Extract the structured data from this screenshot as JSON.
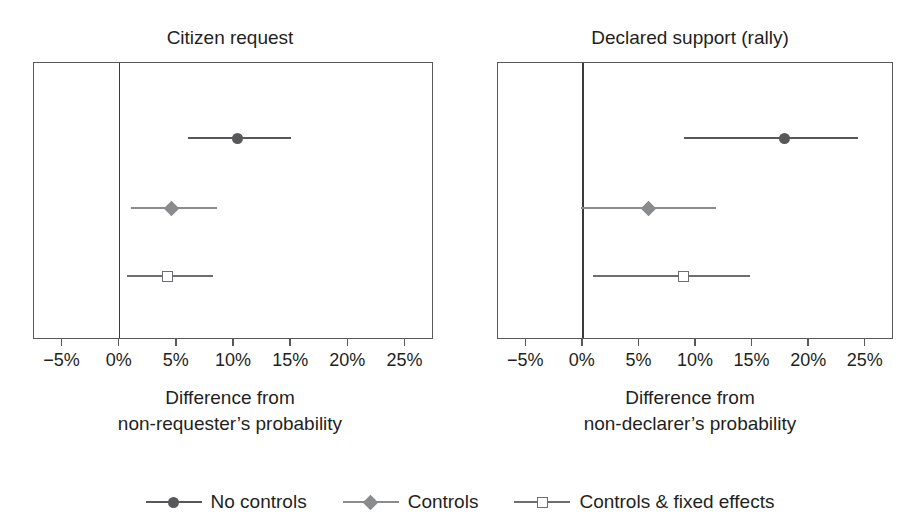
{
  "chart_data": {
    "type": "scatter",
    "subtype": "coefficient-plot-with-confidence-intervals",
    "title": "",
    "xlabel": "",
    "ylabel": "",
    "xlim": [
      -7.5,
      27.5
    ],
    "xticks": [
      -5,
      0,
      5,
      10,
      15,
      20,
      25
    ],
    "xtick_labels": [
      "−5%",
      "0%",
      "5%",
      "10%",
      "15%",
      "20%",
      "25%"
    ],
    "grid": false,
    "reference_line": 0,
    "legend_position": "bottom",
    "units": "percentage points",
    "series": [
      {
        "name": "No controls",
        "marker": "filled-circle",
        "color": "#58585a"
      },
      {
        "name": "Controls",
        "marker": "filled-diamond",
        "color": "#8a8b8d"
      },
      {
        "name": "Controls & fixed effects",
        "marker": "open-square",
        "color": "#6d6e71"
      }
    ],
    "panels": [
      {
        "title": "Citizen request",
        "xlabel_line1": "Difference from",
        "xlabel_line2": "non-requester’s probability",
        "points": [
          {
            "series": "No controls",
            "estimate": 10.3,
            "ci_low": 6.0,
            "ci_high": 15.0
          },
          {
            "series": "Controls",
            "estimate": 4.5,
            "ci_low": 1.0,
            "ci_high": 8.5
          },
          {
            "series": "Controls & fixed effects",
            "estimate": 4.2,
            "ci_low": 0.6,
            "ci_high": 8.2
          }
        ]
      },
      {
        "title": "Declared support (rally)",
        "xlabel_line1": "Difference from",
        "xlabel_line2": "non-declarer’s probability",
        "points": [
          {
            "series": "No controls",
            "estimate": 17.8,
            "ci_low": 8.9,
            "ci_high": 24.3
          },
          {
            "series": "Controls",
            "estimate": 5.8,
            "ci_low": -0.2,
            "ci_high": 11.8
          },
          {
            "series": "Controls & fixed effects",
            "estimate": 8.9,
            "ci_low": 0.9,
            "ci_high": 14.8
          }
        ]
      }
    ]
  },
  "panel_left": {
    "title": "Citizen request",
    "caption_line1": "Difference from",
    "caption_line2": "non-requester’s probability",
    "ticks": [
      "−5%",
      "0%",
      "5%",
      "10%",
      "15%",
      "20%",
      "25%"
    ]
  },
  "panel_right": {
    "title": "Declared support (rally)",
    "caption_line1": "Difference from",
    "caption_line2": "non-declarer’s probability",
    "ticks": [
      "−5%",
      "0%",
      "5%",
      "10%",
      "15%",
      "20%",
      "25%"
    ]
  },
  "legend": {
    "items": [
      {
        "label": "No controls",
        "marker": "filled-circle",
        "color": "#58585a"
      },
      {
        "label": "Controls",
        "marker": "filled-diamond",
        "color": "#8a8b8d"
      },
      {
        "label": "Controls & fixed effects",
        "marker": "open-square",
        "color": "#6d6e71"
      }
    ]
  }
}
